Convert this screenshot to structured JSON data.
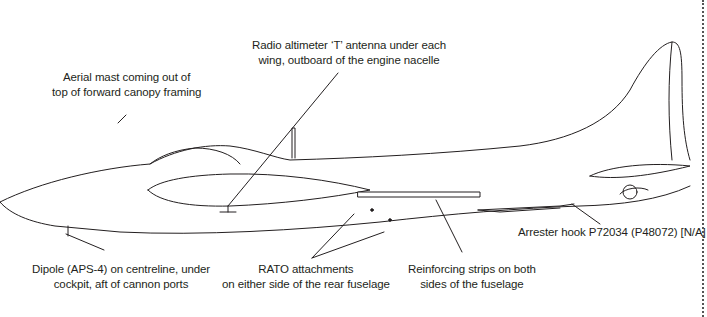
{
  "diagram": {
    "colors": {
      "line": "#231f20",
      "background": "#ffffff",
      "leader": "#231f20"
    },
    "labels": [
      {
        "id": "aerial-mast",
        "lines": [
          "Aerial mast coming out of",
          "top of forward canopy framing"
        ]
      },
      {
        "id": "radio-altimeter",
        "lines": [
          "Radio altimeter ‘T’ antenna under each",
          "wing, outboard of the engine nacelle"
        ]
      },
      {
        "id": "arrester-hook",
        "lines": [
          "Arrester hook P72034 (P48072) [N/A]"
        ]
      },
      {
        "id": "dipole",
        "lines": [
          "Dipole (APS-4) on centreline, under",
          "cockpit, aft of cannon ports"
        ]
      },
      {
        "id": "rato",
        "lines": [
          "RATO attachments",
          "on either side of the rear fuselage"
        ]
      },
      {
        "id": "reinforcing-strips",
        "lines": [
          "Reinforcing strips on both",
          "sides of the fuselage"
        ]
      }
    ]
  }
}
